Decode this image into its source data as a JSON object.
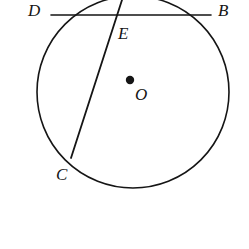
{
  "figure": {
    "kind": "circle-geometry-diagram",
    "canvas": {
      "width": 249,
      "height": 249,
      "background": "#ffffff"
    },
    "stroke_color": "#151515",
    "stroke_width": 1.6,
    "circle": {
      "name": "circle-O",
      "center_x": 133,
      "center_y": 92,
      "radius": 96,
      "note": "circle is cropped by the top edge of the image"
    },
    "center_point": {
      "name": "center-dot",
      "x": 130,
      "y": 80,
      "radius": 4.2,
      "fill": "#151515"
    },
    "chord_db": {
      "name": "chord-DB",
      "x1": 51,
      "y1": 15,
      "x2": 211,
      "y2": 15
    },
    "secant_ce": {
      "name": "secant-CE",
      "x1": 122,
      "y1": 0,
      "x2": 71,
      "y2": 158
    },
    "labels": {
      "D": "D",
      "B": "B",
      "E": "E",
      "O": "O",
      "C": "C"
    }
  }
}
